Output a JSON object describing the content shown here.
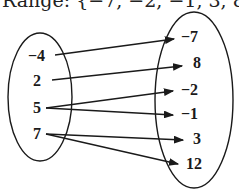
{
  "header": {
    "text": "Range: {−7, −2, −1, 3, 8, 12}"
  },
  "diagram": {
    "type": "mapping-diagram",
    "domain_values": [
      "−4",
      "2",
      "5",
      "7"
    ],
    "range_values": [
      "−7",
      "8",
      "−2",
      "−1",
      "3",
      "12"
    ],
    "mappings": [
      {
        "from": "−4",
        "to": "−7"
      },
      {
        "from": "2",
        "to": "8"
      },
      {
        "from": "5",
        "to": "−2"
      },
      {
        "from": "5",
        "to": "−1"
      },
      {
        "from": "7",
        "to": "3"
      },
      {
        "from": "7",
        "to": "12"
      }
    ],
    "stroke_color": "#1a1a1a"
  }
}
